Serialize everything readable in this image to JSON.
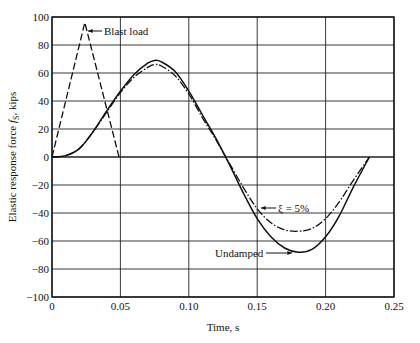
{
  "chart_data": {
    "type": "line",
    "title": "",
    "xlabel": "Time, s",
    "ylabel": "Elastic response force f_S, kips",
    "ylabel_main": "Elastic response force ",
    "ylabel_sym": "f",
    "ylabel_sub": "S",
    "ylabel_unit": ", kips",
    "xlim": [
      0,
      0.25
    ],
    "ylim": [
      -100,
      100
    ],
    "grid": true,
    "x_ticks": [
      0,
      0.05,
      0.1,
      0.15,
      0.2,
      0.25
    ],
    "x_tick_labels": [
      "0",
      "0.05",
      "0.10",
      "0.15",
      "0.20",
      "0.25"
    ],
    "y_ticks": [
      100,
      80,
      60,
      40,
      20,
      0,
      -20,
      -40,
      -60,
      -80,
      -100
    ],
    "y_tick_labels": [
      "100",
      "80",
      "60",
      "40",
      "20",
      "0",
      "−20",
      "−40",
      "−60",
      "−80",
      "−100"
    ],
    "series": [
      {
        "name": "Blast load",
        "style": "dashed",
        "x": [
          0,
          0.024,
          0.049
        ],
        "y": [
          0,
          96,
          0
        ]
      },
      {
        "name": "Undamped",
        "style": "solid",
        "x": [
          0,
          0.01,
          0.02,
          0.03,
          0.04,
          0.05,
          0.06,
          0.07,
          0.075,
          0.08,
          0.09,
          0.1,
          0.11,
          0.12,
          0.13,
          0.14,
          0.15,
          0.16,
          0.17,
          0.18,
          0.19,
          0.2,
          0.21,
          0.22,
          0.232
        ],
        "y": [
          0,
          1,
          6,
          18,
          33,
          47,
          59,
          67,
          69,
          68,
          61,
          47,
          30,
          13,
          -6,
          -26,
          -44,
          -57,
          -65,
          -68,
          -66,
          -57,
          -42,
          -22,
          0
        ]
      },
      {
        "name": "ξ = 5%",
        "style": "dashdot",
        "x": [
          0,
          0.01,
          0.02,
          0.03,
          0.04,
          0.05,
          0.06,
          0.07,
          0.075,
          0.08,
          0.09,
          0.1,
          0.11,
          0.12,
          0.13,
          0.14,
          0.15,
          0.16,
          0.17,
          0.18,
          0.19,
          0.2,
          0.21,
          0.22,
          0.232
        ],
        "y": [
          0,
          1,
          6,
          18,
          32,
          46,
          57,
          64,
          66,
          65,
          58,
          45,
          28,
          12,
          -5,
          -22,
          -37,
          -47,
          -52,
          -53,
          -51,
          -44,
          -32,
          -17,
          0
        ]
      }
    ],
    "annotations": [
      {
        "text": "Blast load",
        "target_series": "Blast load"
      },
      {
        "text": "ξ = 5%",
        "target_series": "ξ = 5%"
      },
      {
        "text": "Undamped",
        "target_series": "Undamped"
      }
    ]
  }
}
